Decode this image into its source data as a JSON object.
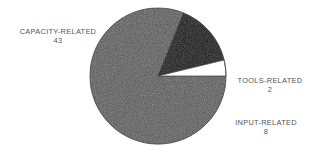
{
  "chart_data": {
    "type": "pie",
    "title": "",
    "subtitle": "",
    "xlabel": "",
    "ylabel": "",
    "legend_position": "none",
    "grid": false,
    "total": 53,
    "categories": [
      "CAPACITY-RELATED",
      "TOOLS-RELATED",
      "INPUT-RELATED"
    ],
    "values": [
      43,
      2,
      8
    ],
    "slices": [
      {
        "label": "CAPACITY-RELATED",
        "value": 43,
        "value_text": "43",
        "color": "#575757",
        "percent": 81.1,
        "start_angle": 0,
        "end_angle": 292.1,
        "label_position": "left"
      },
      {
        "label": "TOOLS-RELATED",
        "value": 2,
        "value_text": "2",
        "color": "#ffffff",
        "percent": 3.8,
        "start_angle": 346.4,
        "end_angle": 360,
        "label_position": "right"
      },
      {
        "label": "INPUT-RELATED",
        "value": 8,
        "value_text": "8",
        "color": "#0a0a0a",
        "percent": 15.1,
        "start_angle": 292.1,
        "end_angle": 346.4,
        "label_position": "bottom-right"
      }
    ],
    "geometry": {
      "center_x": 158,
      "center_y": 76,
      "radius": 68
    },
    "colors": {
      "background": "#ffffff",
      "outline": "#3a3a3a",
      "text": "#555555",
      "capacity_fill": "#575757",
      "tools_fill": "#ffffff",
      "input_fill": "#0a0a0a"
    }
  }
}
